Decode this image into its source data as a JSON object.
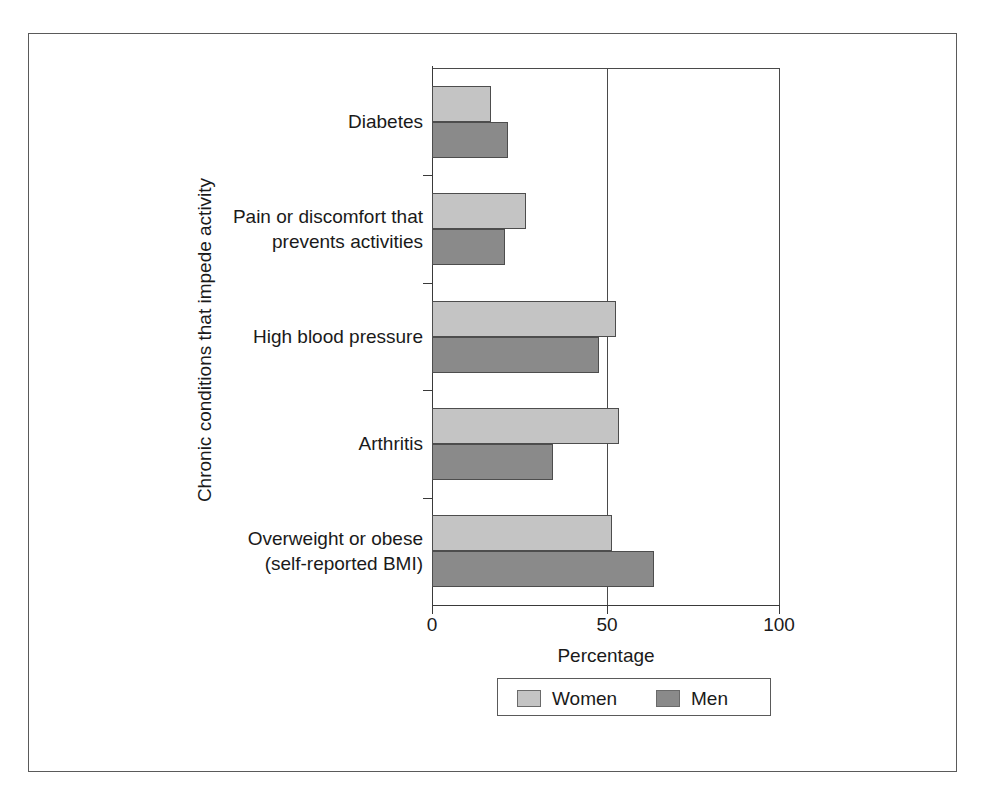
{
  "figure": {
    "ghost_header_left": "",
    "ghost_header_right": ""
  },
  "chart_data": {
    "type": "bar",
    "orientation": "horizontal",
    "title": "",
    "xlabel": "Percentage",
    "ylabel": "Chronic conditions that impede activity",
    "xlim": [
      0,
      100
    ],
    "xticks": [
      0,
      50,
      100
    ],
    "xtick_labels": [
      "0",
      "50",
      "100"
    ],
    "grid": "vertical gridlines at 50 and 100",
    "legend_position": "bottom-center",
    "categories": [
      "Diabetes",
      "Pain or discomfort that prevents activities",
      "High blood pressure",
      "Arthritis",
      "Overweight or obese (self-reported BMI)"
    ],
    "category_label_lines": [
      [
        "Diabetes"
      ],
      [
        "Pain or discomfort that",
        "prevents activities"
      ],
      [
        "High blood pressure"
      ],
      [
        "Arthritis"
      ],
      [
        "Overweight or obese",
        "(self-reported BMI)"
      ]
    ],
    "series": [
      {
        "name": "Women",
        "color": "#c4c4c4",
        "values": [
          17,
          27,
          53,
          54,
          52
        ]
      },
      {
        "name": "Men",
        "color": "#8a8a8a",
        "values": [
          22,
          21,
          48,
          35,
          64
        ]
      }
    ]
  },
  "legend": {
    "items": [
      {
        "label": "Women",
        "color": "#c4c4c4"
      },
      {
        "label": "Men",
        "color": "#8a8a8a"
      }
    ]
  }
}
